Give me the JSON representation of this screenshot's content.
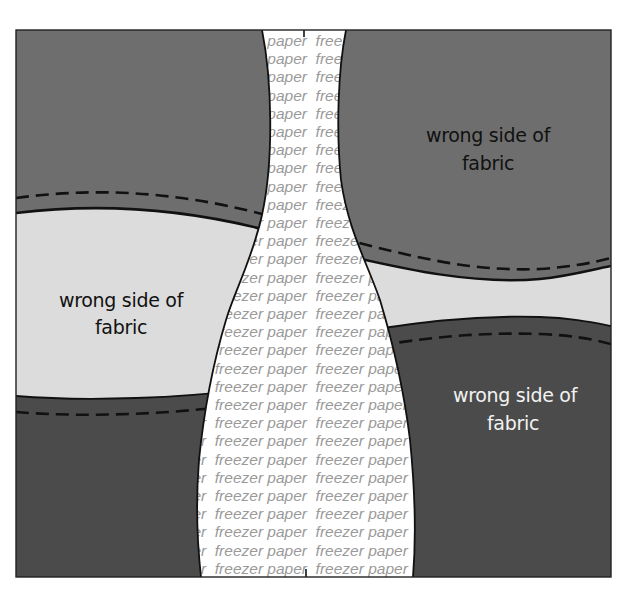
{
  "diagram": {
    "title": "",
    "frame": {
      "left": 16,
      "top": 30,
      "right": 611,
      "bottom": 577
    },
    "colors": {
      "background": "#ffffff",
      "fabric_medium": "#6e6e6e",
      "fabric_dark": "#4b4b4b",
      "fabric_light": "#dcdcdc",
      "freezer_paper": "#ffffff",
      "freezer_paper_text": "#9a9a9a",
      "outline": "#111111",
      "label_dark_text": "#111111",
      "label_light_text": "#f2f2f2"
    },
    "labels": {
      "top_right": {
        "line1": "wrong side of",
        "line2": "fabric"
      },
      "middle_left": {
        "line1": "wrong side of",
        "line2": "fabric"
      },
      "bottom_right": {
        "line1": "wrong side of",
        "line2": "fabric"
      }
    },
    "freezer_paper": {
      "word1": "freezer",
      "word2": "paper",
      "repeated_text": "freezer paper"
    },
    "regions": [
      {
        "name": "top-left-fabric",
        "shade": "medium"
      },
      {
        "name": "middle-left-fabric",
        "shade": "light",
        "label": "wrong side of fabric"
      },
      {
        "name": "bottom-left-fabric",
        "shade": "dark"
      },
      {
        "name": "top-right-fabric",
        "shade": "medium",
        "label": "wrong side of fabric"
      },
      {
        "name": "middle-right-fabric",
        "shade": "light"
      },
      {
        "name": "bottom-right-fabric",
        "shade": "dark",
        "label": "wrong side of fabric"
      },
      {
        "name": "freezer-paper-strip",
        "shade": "white",
        "text": "freezer paper"
      }
    ]
  }
}
